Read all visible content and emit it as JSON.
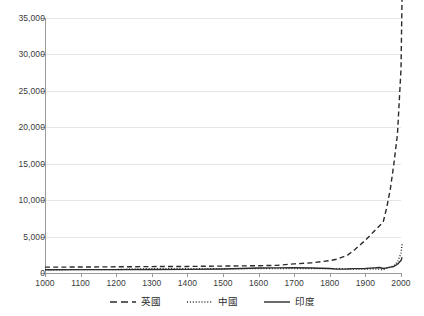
{
  "chart_data": {
    "type": "line",
    "title": "",
    "xlabel": "",
    "ylabel": "",
    "xlim": [
      1000,
      2000
    ],
    "ylim": [
      0,
      35000
    ],
    "grid": true,
    "legend_position": "bottom",
    "x_ticks": [
      "1000",
      "1100",
      "1200",
      "1300",
      "1400",
      "1500",
      "1600",
      "1700",
      "1800",
      "1900",
      "2000"
    ],
    "y_ticks": [
      "0",
      "5,000",
      "10,000",
      "15,000",
      "20,000",
      "25,000",
      "30,000",
      "35,000"
    ],
    "series": [
      {
        "name": "英國",
        "style": "dashed",
        "color": "#2b2b2b",
        "x": [
          1000,
          1100,
          1200,
          1300,
          1400,
          1500,
          1600,
          1650,
          1700,
          1750,
          1800,
          1820,
          1850,
          1870,
          1900,
          1913,
          1930,
          1950,
          1960,
          1970,
          1980,
          1990,
          2000,
          2003
        ],
        "values": [
          800,
          820,
          850,
          880,
          900,
          950,
          1000,
          1050,
          1250,
          1400,
          1700,
          1900,
          2450,
          3200,
          4500,
          5150,
          6000,
          7000,
          9000,
          11500,
          15000,
          19000,
          28000,
          38000
        ]
      },
      {
        "name": "中國",
        "style": "dotted",
        "color": "#2b2b2b",
        "x": [
          1000,
          1100,
          1200,
          1300,
          1400,
          1500,
          1600,
          1700,
          1800,
          1820,
          1850,
          1870,
          1900,
          1913,
          1930,
          1950,
          1960,
          1970,
          1980,
          1990,
          2000,
          2003
        ],
        "values": [
          450,
          460,
          470,
          600,
          600,
          600,
          600,
          600,
          600,
          600,
          600,
          530,
          545,
          552,
          560,
          450,
          650,
          780,
          1000,
          1500,
          2700,
          4000
        ]
      },
      {
        "name": "印度",
        "style": "solid",
        "color": "#2b2b2b",
        "x": [
          1000,
          1100,
          1200,
          1300,
          1400,
          1500,
          1600,
          1650,
          1700,
          1750,
          1800,
          1820,
          1850,
          1870,
          1900,
          1913,
          1930,
          1940,
          1950,
          1960,
          1970,
          1980,
          1990,
          2000,
          2003
        ],
        "values": [
          450,
          460,
          470,
          480,
          500,
          550,
          680,
          700,
          720,
          680,
          620,
          533,
          540,
          600,
          620,
          673,
          720,
          760,
          619,
          700,
          800,
          900,
          1200,
          1700,
          2160
        ]
      }
    ]
  },
  "legend": {
    "items": [
      {
        "label": "英國",
        "style": "dashed"
      },
      {
        "label": "中國",
        "style": "dotted"
      },
      {
        "label": "印度",
        "style": "solid"
      }
    ]
  }
}
